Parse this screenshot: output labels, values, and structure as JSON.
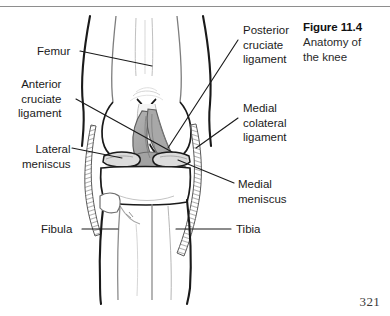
{
  "page": {
    "folio": "321",
    "top_rule_color": "#8e8e8e"
  },
  "caption": {
    "figure_number": "Figure 11.4",
    "line1": "Anatomy of",
    "line2": "the knee",
    "full_text": "Figure 11.4 Anatomy of the knee"
  },
  "labels": {
    "femur": "Femur",
    "anterior_cruciate_ligament_l1": "Anterior",
    "anterior_cruciate_ligament_l2": "cruciate",
    "anterior_cruciate_ligament_l3": "ligament",
    "lateral_meniscus_l1": "Lateral",
    "lateral_meniscus_l2": "meniscus",
    "fibula": "Fibula",
    "posterior_cruciate_ligament_l1": "Posterior",
    "posterior_cruciate_ligament_l2": "cruciate",
    "posterior_cruciate_ligament_l3": "ligament",
    "medial_colateral_ligament_l1": "Medial",
    "medial_colateral_ligament_l2": "colateral",
    "medial_colateral_ligament_l3": "ligament",
    "medial_meniscus_l1": "Medial",
    "medial_meniscus_l2": "meniscus",
    "tibia": "Tibia"
  },
  "colors": {
    "bone_outline": "#1a1a1a",
    "bone_fill": "#ffffff",
    "inner_line": "#9b9b9b",
    "ligament_gray": "#9a9a9a",
    "ligament_dark": "#6e6e6e",
    "meniscus_fill": "#d8d8d8",
    "leader_line": "#1b1b1b",
    "text": "#1b1b1b"
  }
}
